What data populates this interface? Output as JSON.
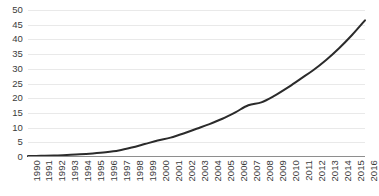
{
  "chart_data": {
    "type": "line",
    "title": "",
    "subtitle": "",
    "xlabel": "",
    "ylabel": "",
    "legend": [],
    "legend_position": "none",
    "grid": true,
    "grid_axis": "y",
    "xlim": [
      1990,
      2016
    ],
    "ylim": [
      0,
      50
    ],
    "y_ticks": [
      0,
      5,
      10,
      15,
      20,
      25,
      30,
      35,
      40,
      45,
      50
    ],
    "y_tick_labels": [
      "0",
      "5",
      "10",
      "15",
      "20",
      "25",
      "30",
      "35",
      "40",
      "45",
      "50"
    ],
    "x_tick_labels": [
      "1990",
      "1991",
      "1992",
      "1993",
      "1994",
      "1995",
      "1996",
      "1997",
      "1998",
      "1999",
      "2000",
      "2001",
      "2002",
      "2003",
      "2004",
      "2005",
      "2006",
      "2007",
      "2008",
      "2009",
      "2010",
      "2011",
      "2012",
      "2013",
      "2014",
      "2015",
      "2016"
    ],
    "categories": [
      1990,
      1991,
      1992,
      1993,
      1994,
      1995,
      1996,
      1997,
      1998,
      1999,
      2000,
      2001,
      2002,
      2003,
      2004,
      2005,
      2006,
      2007,
      2008,
      2009,
      2010,
      2011,
      2012,
      2013,
      2014,
      2015,
      2016
    ],
    "values": [
      0.3,
      0.4,
      0.5,
      0.7,
      0.9,
      1.2,
      1.6,
      2.2,
      3.2,
      4.4,
      5.6,
      6.6,
      8.0,
      9.6,
      11.2,
      13.0,
      15.2,
      17.6,
      18.6,
      20.8,
      23.5,
      26.5,
      29.5,
      33.0,
      37.0,
      41.5,
      46.5
    ],
    "series": [
      {
        "name": "series-1",
        "color": "#2b2b2b",
        "line_width": 2,
        "markers": false,
        "values": [
          0.3,
          0.4,
          0.5,
          0.7,
          0.9,
          1.2,
          1.6,
          2.2,
          3.2,
          4.4,
          5.6,
          6.6,
          8.0,
          9.6,
          11.2,
          13.0,
          15.2,
          17.6,
          18.6,
          20.8,
          23.5,
          26.5,
          29.5,
          33.0,
          37.0,
          41.5,
          46.5
        ]
      }
    ],
    "colors": {
      "line": "#2b2b2b",
      "gridline": "#e9e9e9",
      "axis": "#8e8e8e",
      "tick_label": "#3b3b3b",
      "background": "#ffffff"
    }
  }
}
